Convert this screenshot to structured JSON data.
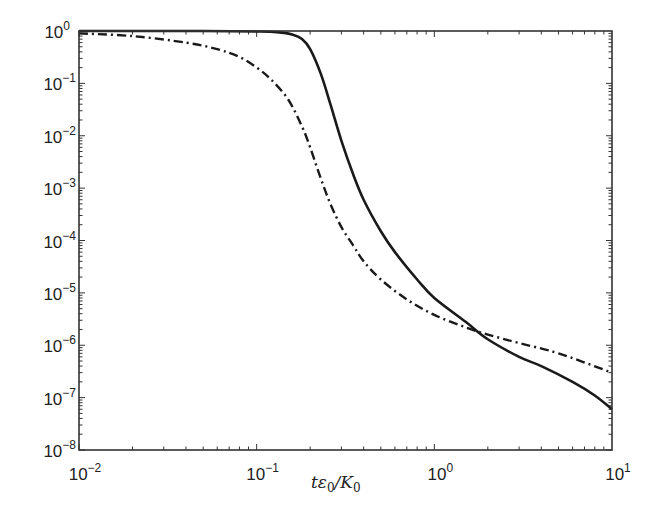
{
  "chart_data": {
    "type": "line",
    "title": "",
    "xlabel": "tε0/K0",
    "ylabel": "",
    "xscale": "log",
    "yscale": "log",
    "xlim": [
      0.01,
      10
    ],
    "ylim": [
      1e-08,
      1
    ],
    "grid": false,
    "legend": null,
    "x_ticks": [
      {
        "base": "10",
        "exp": "−2",
        "value": 0.01
      },
      {
        "base": "10",
        "exp": "−1",
        "value": 0.1
      },
      {
        "base": "10",
        "exp": "0",
        "value": 1
      },
      {
        "base": "10",
        "exp": "1",
        "value": 10
      }
    ],
    "y_ticks": [
      {
        "base": "10",
        "exp": "0",
        "value": 1
      },
      {
        "base": "10",
        "exp": "−1",
        "value": 0.1
      },
      {
        "base": "10",
        "exp": "−2",
        "value": 0.01
      },
      {
        "base": "10",
        "exp": "−3",
        "value": 0.001
      },
      {
        "base": "10",
        "exp": "−4",
        "value": 0.0001
      },
      {
        "base": "10",
        "exp": "−5",
        "value": 1e-05
      },
      {
        "base": "10",
        "exp": "−6",
        "value": 1e-06
      },
      {
        "base": "10",
        "exp": "−7",
        "value": 1e-07
      },
      {
        "base": "10",
        "exp": "−8",
        "value": 1e-08
      }
    ],
    "series": [
      {
        "name": "solid",
        "style": "solid",
        "color": "#1a1a1a",
        "x": [
          0.01,
          0.05,
          0.1,
          0.13,
          0.16,
          0.18,
          0.2,
          0.23,
          0.26,
          0.3,
          0.35,
          0.4,
          0.5,
          0.6,
          0.8,
          1.0,
          1.5,
          2.0,
          3.0,
          4.0,
          6.0,
          8.0,
          10.0
        ],
        "y": [
          1.0,
          1.0,
          0.98,
          0.95,
          0.85,
          0.7,
          0.45,
          0.15,
          0.04,
          0.008,
          0.0018,
          0.0006,
          0.00015,
          6e-05,
          1.8e-05,
          8e-06,
          2.8e-06,
          1.3e-06,
          6e-07,
          4e-07,
          2e-07,
          1.1e-07,
          6e-08
        ]
      },
      {
        "name": "dash-dot",
        "style": "dashdot",
        "color": "#1a1a1a",
        "x": [
          0.01,
          0.02,
          0.04,
          0.06,
          0.08,
          0.1,
          0.12,
          0.15,
          0.18,
          0.2,
          0.23,
          0.26,
          0.3,
          0.35,
          0.4,
          0.5,
          0.7,
          1.0,
          1.5,
          2.0,
          3.0,
          5.0,
          10.0
        ],
        "y": [
          0.9,
          0.8,
          0.6,
          0.45,
          0.32,
          0.2,
          0.12,
          0.05,
          0.015,
          0.006,
          0.0015,
          0.0005,
          0.00018,
          8e-05,
          4e-05,
          1.8e-05,
          7.5e-06,
          3.8e-06,
          2.2e-06,
          1.6e-06,
          1.1e-06,
          7e-07,
          3e-07
        ]
      }
    ]
  }
}
